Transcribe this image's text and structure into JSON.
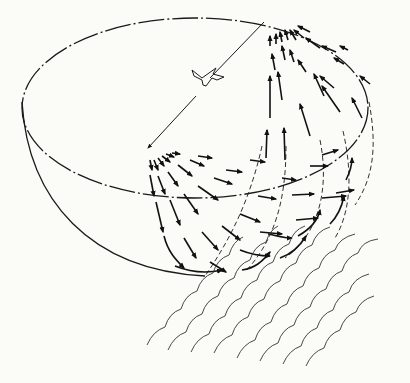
{
  "diagram": {
    "title": "",
    "elements": {
      "rim": "ellipse",
      "bowl": "hemisphere outline",
      "bird": "flying bird glyph",
      "source_point": "front rim point (diverging arrows)",
      "sink_point": "back rim point (converging arrows)",
      "meridians": "dashed curves",
      "waves": "scalloped parallel lines"
    },
    "colors": {
      "background": "#fbfbf7",
      "ink": "#1a1a1a"
    }
  }
}
